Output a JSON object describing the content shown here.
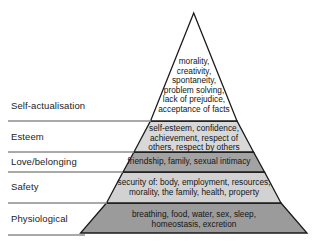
{
  "diagram": {
    "type": "pyramid",
    "colors": {
      "outline": "#1a1a1a",
      "rule": "#8c8c8c",
      "text": "#151515",
      "fill_self_actualisation": "#ffffff",
      "fill_esteem": "#d8d8d8",
      "fill_love_belonging": "#a3a3a3",
      "fill_safety": "#d2d2d2",
      "fill_physiological": "#9b9b9b"
    },
    "tiers": [
      {
        "id": "self-actualisation",
        "label": "Self-actualisation",
        "description": "morality,\ncreativity,\nspontaneity,\nproblem solving,\nlack of prejudice,\nacceptance of facts",
        "fill": "#ffffff"
      },
      {
        "id": "esteem",
        "label": "Esteem",
        "description": "self-esteem, confidence,\nachievement, respect of\nothers, respect by others",
        "fill": "#d8d8d8"
      },
      {
        "id": "love-belonging",
        "label": "Love/belonging",
        "description": "friendship, family, sexual intimacy",
        "fill": "#a3a3a3"
      },
      {
        "id": "safety",
        "label": "Safety",
        "description": "security of: body, employment, resources,\nmorality, the family, health, property",
        "fill": "#d2d2d2"
      },
      {
        "id": "physiological",
        "label": "Physiological",
        "description": "breathing, food, water, sex, sleep,\nhomeostasis, excretion",
        "fill": "#9b9b9b"
      }
    ]
  }
}
